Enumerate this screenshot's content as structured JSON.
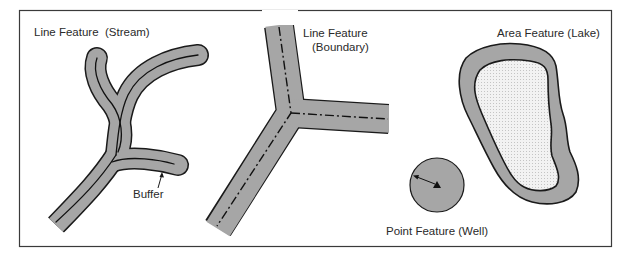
{
  "diagram": {
    "colors": {
      "frame": "#3a3a3a",
      "buffer_fill": "#a6a6a6",
      "outline": "#1a1a1a",
      "lake_fill": "#eeeeee",
      "text": "#2a2a2a"
    },
    "features": [
      {
        "id": "stream",
        "label": "Line Feature  (Stream)",
        "type": "line"
      },
      {
        "id": "boundary",
        "label_line1": "Line Feature",
        "label_line2": "(Boundary)",
        "type": "line"
      },
      {
        "id": "lake",
        "label": "Area Feature (Lake)",
        "type": "area"
      },
      {
        "id": "well",
        "label": "Point Feature (Well)",
        "type": "point"
      }
    ],
    "annotations": {
      "buffer": "Buffer"
    }
  }
}
